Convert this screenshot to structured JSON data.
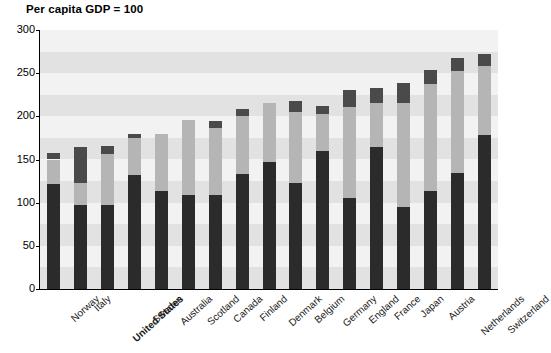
{
  "chart_data": {
    "type": "bar",
    "subtype": "stacked-bar",
    "title": "Per capita GDP = 100",
    "xlabel": "",
    "ylabel": "",
    "ylim": [
      0,
      300
    ],
    "ytick_values": [
      0,
      50,
      100,
      150,
      200,
      250,
      300
    ],
    "ytick_labels": [
      "0",
      "50",
      "100",
      "150",
      "200",
      "250",
      "300"
    ],
    "grid": false,
    "background_bands": true,
    "band_interval": 25,
    "legend": null,
    "legend_position": "none",
    "categories": [
      "Norway",
      "Italy",
      "United States",
      "Sweden",
      "Australia",
      "Scotland",
      "Canada",
      "Finland",
      "Denmark",
      "Belgium",
      "Germany",
      "England",
      "France",
      "Japan",
      "Austria",
      "Netherlands",
      "Switzerland"
    ],
    "highlighted_categories": [
      "United States"
    ],
    "series": [
      {
        "name": "lower",
        "color": "#2b2b2b",
        "values": [
          122,
          97,
          97,
          132,
          113,
          109,
          109,
          133,
          147,
          123,
          160,
          105,
          165,
          95,
          114,
          134,
          178
        ]
      },
      {
        "name": "middle",
        "color": "#b5b5b5",
        "values": [
          150,
          123,
          156,
          175,
          179,
          196,
          187,
          200,
          215,
          205,
          203,
          211,
          216,
          215,
          238,
          253,
          258
        ]
      },
      {
        "name": "upper",
        "color": "#4a4a4a",
        "values": [
          158,
          164,
          166,
          180,
          179,
          196,
          195,
          209,
          215,
          218,
          212,
          231,
          233,
          239,
          254,
          268,
          272
        ]
      }
    ],
    "totals": [
      158,
      164,
      166,
      180,
      179,
      196,
      195,
      209,
      215,
      218,
      212,
      231,
      233,
      239,
      254,
      268,
      272
    ]
  },
  "colors": {
    "plot_background": "#f2f2f2",
    "band_light": "#f2f2f2",
    "band_dark": "#e2e2e2",
    "axis": "#000000",
    "bar_base": "#2b2b2b",
    "bar_mid": "#b5b5b5",
    "bar_cap": "#4a4a4a",
    "text": "#000000"
  }
}
